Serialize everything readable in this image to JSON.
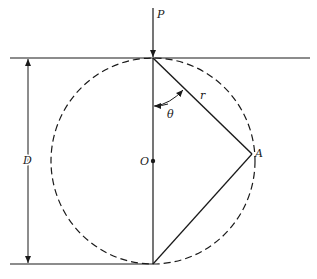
{
  "diagram": {
    "labels": {
      "load": "P",
      "radius": "r",
      "angle": "θ",
      "center": "O",
      "point": "A",
      "diameter": "D"
    },
    "colors": {
      "stroke": "#1a1a1a",
      "background": "#ffffff"
    }
  }
}
